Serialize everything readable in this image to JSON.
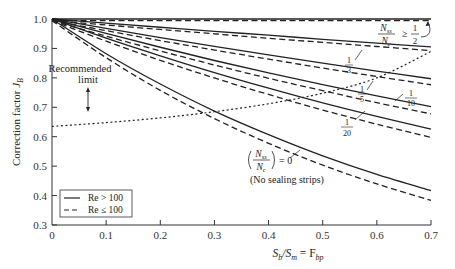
{
  "chart_data": {
    "type": "line",
    "title": "",
    "xlabel": "S_b/S_m = F_bp",
    "ylabel": "Correction factor J_B",
    "xlim": [
      0,
      0.7
    ],
    "ylim": [
      0.3,
      1.0
    ],
    "grid": false,
    "x_ticks": [
      "0",
      "0.1",
      "0.2",
      "0.3",
      "0.4",
      "0.5",
      "0.6",
      "0.7"
    ],
    "y_ticks": [
      "0.3",
      "0.4",
      "0.5",
      "0.6",
      "0.7",
      "0.8",
      "0.9",
      "1.0"
    ],
    "x": [
      0,
      0.1,
      0.2,
      0.3,
      0.4,
      0.5,
      0.6,
      0.7
    ],
    "series": [
      {
        "name": "Nss/Nc >= 1/2, Re > 100",
        "style": "solid",
        "values": [
          1.0,
          1.0,
          1.0,
          1.0,
          1.0,
          1.0,
          1.0,
          1.0
        ]
      },
      {
        "name": "Nss/Nc >= 1/2, Re <= 100",
        "style": "dashed",
        "values": [
          1.0,
          1.0,
          1.0,
          1.0,
          1.0,
          1.0,
          1.0,
          1.0
        ]
      },
      {
        "name": "Nss/Nc = 1/3, Re > 100",
        "style": "solid",
        "values": [
          1.0,
          0.986,
          0.972,
          0.958,
          0.945,
          0.931,
          0.918,
          0.905
        ]
      },
      {
        "name": "Nss/Nc = 1/3, Re <= 100",
        "style": "dashed",
        "values": [
          1.0,
          0.985,
          0.97,
          0.955,
          0.94,
          0.926,
          0.912,
          0.898
        ]
      },
      {
        "name": "Nss/Nc = 1/5, Re > 100",
        "style": "solid",
        "values": [
          1.0,
          0.968,
          0.937,
          0.907,
          0.878,
          0.85,
          0.823,
          0.797
        ]
      },
      {
        "name": "Nss/Nc = 1/5, Re <= 100",
        "style": "dashed",
        "values": [
          1.0,
          0.966,
          0.932,
          0.9,
          0.869,
          0.839,
          0.81,
          0.782
        ]
      },
      {
        "name": "Nss/Nc = 1/10, Re > 100",
        "style": "solid",
        "values": [
          1.0,
          0.951,
          0.904,
          0.859,
          0.817,
          0.777,
          0.739,
          0.702
        ]
      },
      {
        "name": "Nss/Nc = 1/10, Re <= 100",
        "style": "dashed",
        "values": [
          1.0,
          0.947,
          0.897,
          0.849,
          0.804,
          0.762,
          0.721,
          0.683
        ]
      },
      {
        "name": "Nss/Nc = 1/20, Re > 100",
        "style": "solid",
        "values": [
          1.0,
          0.935,
          0.875,
          0.818,
          0.765,
          0.715,
          0.669,
          0.626
        ]
      },
      {
        "name": "Nss/Nc = 1/20, Re <= 100",
        "style": "dashed",
        "values": [
          1.0,
          0.93,
          0.865,
          0.805,
          0.749,
          0.696,
          0.648,
          0.603
        ]
      },
      {
        "name": "Nss/Nc = 0 (No sealing strips), Re > 100",
        "style": "solid",
        "values": [
          1.0,
          0.882,
          0.779,
          0.687,
          0.607,
          0.535,
          0.472,
          0.417
        ]
      },
      {
        "name": "Nss/Nc = 0 (No sealing strips), Re <= 100",
        "style": "dashed",
        "values": [
          1.0,
          0.874,
          0.763,
          0.667,
          0.583,
          0.509,
          0.445,
          0.389
        ]
      },
      {
        "name": "Recommended limit",
        "style": "dotted",
        "values": [
          0.635,
          0.648,
          0.664,
          0.685,
          0.712,
          0.748,
          0.8,
          0.89
        ]
      }
    ],
    "annotations": [
      "Nss/Nc >= 1/2",
      "1/3",
      "1/5",
      "1/10",
      "1/20",
      "(Nss/Nc) = 0",
      "(No sealing strips)",
      "Recommended limit"
    ],
    "legend": {
      "position": "lower-left",
      "entries": [
        {
          "label": "Re > 100",
          "style": "solid"
        },
        {
          "label": "Re ≤ 100",
          "style": "dashed"
        }
      ]
    }
  },
  "labels": {
    "ylabel_main": "Correction factor ",
    "ylabel_sym": "J",
    "ylabel_sub": "B",
    "xlabel_sb": "S",
    "xlabel_b": "b",
    "xlabel_sm": "/S",
    "xlabel_m": "m",
    "xlabel_eq": " = F",
    "xlabel_bp": "bp",
    "rec_line1": "Recommended",
    "rec_line2": "limit",
    "half_label_ge": "≥",
    "frac_num_nss": "N",
    "frac_sub_ss": "ss",
    "frac_den_nc": "N",
    "frac_sub_c": "c",
    "one": "1",
    "two": "2",
    "three": "3",
    "five": "5",
    "ten": "10",
    "twenty": "20",
    "zero_eq": "= 0",
    "no_strips": "(No sealing strips)",
    "legend_re_gt": "Re > 100",
    "legend_re_le": "Re ≤ 100"
  }
}
